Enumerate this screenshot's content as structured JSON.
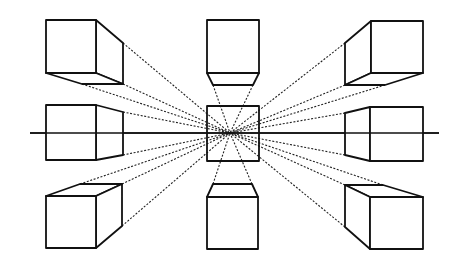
{
  "figure": {
    "width": 462,
    "height": 266,
    "background": "#ffffff",
    "stroke_color": "#111111",
    "vanishing_point": {
      "x": 230,
      "y": 133
    },
    "horizon": {
      "x1": 30,
      "x2": 439,
      "y": 133
    },
    "center_square": {
      "x": 207,
      "y": 106,
      "w": 52,
      "h": 55
    },
    "cubes": [
      {
        "id": "top-left",
        "front": {
          "x": 46,
          "y": 20,
          "w": 50,
          "h": 53
        },
        "depth_polys": [
          [
            [
              96,
              20
            ],
            [
              123,
              43
            ],
            [
              123,
              84
            ],
            [
              96,
              73
            ]
          ],
          [
            [
              46,
              73
            ],
            [
              96,
              73
            ],
            [
              123,
              84
            ],
            [
              82,
              84
            ]
          ]
        ]
      },
      {
        "id": "top-center",
        "front": {
          "x": 207,
          "y": 20,
          "w": 52,
          "h": 53
        },
        "depth_polys": [
          [
            [
              207,
              73
            ],
            [
              259,
              73
            ],
            [
              253,
              85
            ],
            [
              213,
              85
            ]
          ]
        ]
      },
      {
        "id": "top-right",
        "front": {
          "x": 371,
          "y": 21,
          "w": 52,
          "h": 52
        },
        "depth_polys": [
          [
            [
              371,
              21
            ],
            [
              345,
              43
            ],
            [
              345,
              85
            ],
            [
              371,
              73
            ]
          ],
          [
            [
              345,
              85
            ],
            [
              385,
              85
            ],
            [
              423,
              73
            ],
            [
              371,
              73
            ]
          ]
        ]
      },
      {
        "id": "middle-left",
        "front": {
          "x": 46,
          "y": 105,
          "w": 50,
          "h": 55
        },
        "depth_polys": [
          [
            [
              96,
              105
            ],
            [
              123,
              112
            ],
            [
              123,
              155
            ],
            [
              96,
              160
            ]
          ]
        ]
      },
      {
        "id": "middle-right",
        "front": {
          "x": 370,
          "y": 107,
          "w": 53,
          "h": 54
        },
        "depth_polys": [
          [
            [
              370,
              107
            ],
            [
              345,
              113
            ],
            [
              345,
              155
            ],
            [
              370,
              161
            ]
          ]
        ]
      },
      {
        "id": "bottom-left",
        "front": {
          "x": 46,
          "y": 196,
          "w": 50,
          "h": 52
        },
        "depth_polys": [
          [
            [
              46,
              196
            ],
            [
              80,
              184
            ],
            [
              122,
              184
            ],
            [
              96,
              196
            ]
          ],
          [
            [
              96,
              196
            ],
            [
              122,
              184
            ],
            [
              122,
              226
            ],
            [
              96,
              248
            ]
          ]
        ]
      },
      {
        "id": "bottom-center",
        "front": {
          "x": 207,
          "y": 197,
          "w": 51,
          "h": 52
        },
        "depth_polys": [
          [
            [
              207,
              197
            ],
            [
              213,
              184
            ],
            [
              252,
              184
            ],
            [
              258,
              197
            ]
          ]
        ]
      },
      {
        "id": "bottom-right",
        "front": {
          "x": 370,
          "y": 197,
          "w": 53,
          "h": 52
        },
        "depth_polys": [
          [
            [
              345,
              185
            ],
            [
              383,
              185
            ],
            [
              423,
              197
            ],
            [
              370,
              197
            ]
          ],
          [
            [
              345,
              185
            ],
            [
              370,
              197
            ],
            [
              370,
              249
            ],
            [
              345,
              227
            ]
          ]
        ]
      }
    ],
    "projection_sources": [
      [
        123,
        43
      ],
      [
        123,
        84
      ],
      [
        82,
        84
      ],
      [
        213,
        85
      ],
      [
        253,
        85
      ],
      [
        345,
        43
      ],
      [
        345,
        85
      ],
      [
        385,
        85
      ],
      [
        123,
        112
      ],
      [
        123,
        155
      ],
      [
        345,
        113
      ],
      [
        345,
        155
      ],
      [
        80,
        184
      ],
      [
        122,
        184
      ],
      [
        122,
        226
      ],
      [
        213,
        184
      ],
      [
        252,
        184
      ],
      [
        345,
        185
      ],
      [
        383,
        185
      ],
      [
        345,
        227
      ]
    ]
  }
}
